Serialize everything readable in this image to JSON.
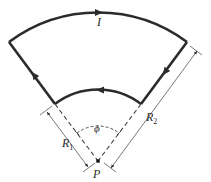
{
  "figure": {
    "labels": {
      "current": "I",
      "inner_radius": "R",
      "inner_radius_sub": "1",
      "outer_radius": "R",
      "outer_radius_sub": "2",
      "angle": "ϕ",
      "point": "P"
    },
    "geometry": {
      "center": [
        98,
        161
      ],
      "inner_radius_px": 71,
      "outer_radius_px": 149,
      "half_angle_deg": 36.8
    },
    "current_direction": "clockwise: outer arc left-to-right, right side downward, inner arc right-to-left, left side upward",
    "colors": {
      "wire": "#2b2b2b",
      "dimension": "#555555",
      "dashed": "#444444"
    }
  }
}
